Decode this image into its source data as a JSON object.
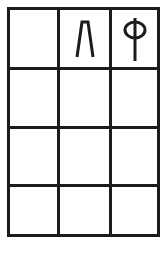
{
  "grid": {
    "rows": 4,
    "cols": 3,
    "line_color": "#1c1c1c",
    "background": "#ffffff",
    "cells": [
      [
        {
          "symbol": "",
          "icon": ""
        },
        {
          "symbol": "Λ",
          "icon": "lambda-like-glyph-icon"
        },
        {
          "symbol": "Φ",
          "icon": "phi-like-glyph-icon"
        }
      ],
      [
        {
          "symbol": "",
          "icon": ""
        },
        {
          "symbol": "",
          "icon": ""
        },
        {
          "symbol": "",
          "icon": ""
        }
      ],
      [
        {
          "symbol": "",
          "icon": ""
        },
        {
          "symbol": "",
          "icon": ""
        },
        {
          "symbol": "",
          "icon": ""
        }
      ],
      [
        {
          "symbol": "",
          "icon": ""
        },
        {
          "symbol": "",
          "icon": ""
        },
        {
          "symbol": "",
          "icon": ""
        }
      ]
    ]
  }
}
